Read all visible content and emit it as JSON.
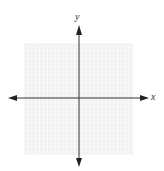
{
  "diagram": {
    "type": "coordinate_plane",
    "x_axis_label": "x",
    "y_axis_label": "y",
    "grid": {
      "cells_x": 28,
      "cells_y": 28,
      "color": "#e6e6e6",
      "background": "#f1f1f1"
    },
    "axis_color": "#333333"
  }
}
